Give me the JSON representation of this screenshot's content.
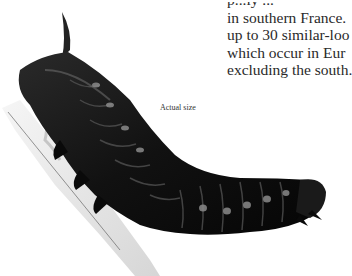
{
  "text_block": {
    "lines": [
      "p...ly ...",
      "in southern France.",
      "up to 30 similar-loo",
      "which occur in Eur",
      "excluding the south."
    ]
  },
  "figure": {
    "caption": "Actual size"
  },
  "colors": {
    "background": "#ffffff",
    "text": "#2a2a2a",
    "caterpillar_body": "#141414",
    "caterpillar_highlight": "#6a6a6a",
    "twig": "#d8d8d8"
  }
}
